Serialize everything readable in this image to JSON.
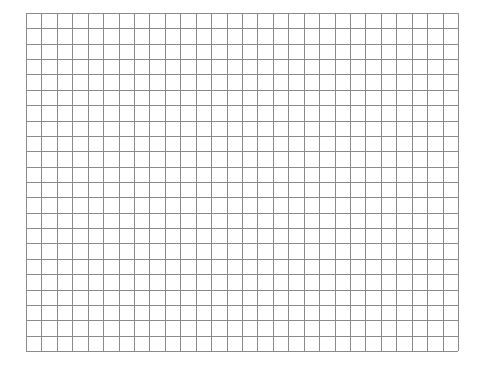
{
  "grid": {
    "columns": 28,
    "rows": 22,
    "left": 26,
    "top": 13,
    "width": 432,
    "height": 338,
    "line_color": "#8a8a8a",
    "background": "#ffffff"
  }
}
